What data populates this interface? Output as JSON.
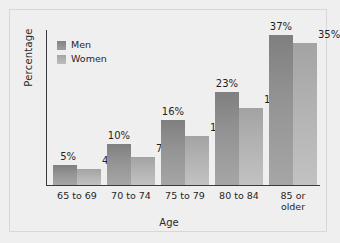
{
  "chart_data": {
    "type": "bar",
    "title": "",
    "subtitle": "",
    "xlabel": "Age",
    "ylabel": "Percentage",
    "categories": [
      "65 to 69",
      "70 to 74",
      "75 to 79",
      "80 to 84",
      "85 or\nolder"
    ],
    "series": [
      {
        "name": "Men",
        "color": "#8c8c8c",
        "values": [
          5,
          10,
          16,
          23,
          37
        ],
        "labels": [
          "5%",
          "10%",
          "16%",
          "23%",
          "37%"
        ]
      },
      {
        "name": "Women",
        "color": "#b3b3b3",
        "values": [
          4,
          7,
          12,
          19,
          35
        ],
        "labels": [
          "4%",
          "7%",
          "12%",
          "19%",
          "35%"
        ]
      }
    ],
    "ylim": [
      0,
      38.5
    ],
    "yticks": [],
    "grid": false,
    "legend_position": "top-left",
    "legend_entries": [
      "Men",
      "Women"
    ]
  },
  "style": {
    "background": "#efefef",
    "frame_border": "#d8d8d8",
    "axis_color": "#3a3a3a",
    "text_color": "#1f1f1f"
  }
}
